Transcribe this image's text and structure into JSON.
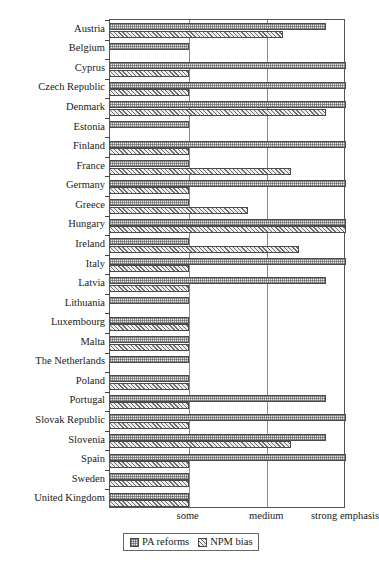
{
  "chart_data": {
    "type": "bar",
    "orientation": "horizontal",
    "title": "",
    "xlabel": "",
    "ylabel": "",
    "grid": true,
    "legend_position": "bottom-center",
    "xlim": [
      0,
      3
    ],
    "xtick_values": [
      1,
      2,
      3
    ],
    "xtick_labels": [
      "some",
      "medium",
      "strong emphasis"
    ],
    "categories": [
      "Austria",
      "Belgium",
      "Cyprus",
      "Czech Republic",
      "Denmark",
      "Estonia",
      "Finland",
      "France",
      "Germany",
      "Greece",
      "Hungary",
      "Ireland",
      "Italy",
      "Latvia",
      "Lithuania",
      "Luxembourg",
      "Malta",
      "The Netherlands",
      "Poland",
      "Portugal",
      "Slovak Republic",
      "Slovenia",
      "Spain",
      "Sweden",
      "United Kingdom"
    ],
    "series": [
      {
        "name": "PA reforms",
        "pattern": "dotted",
        "values": [
          2.75,
          1.0,
          3.0,
          3.0,
          3.0,
          1.0,
          3.0,
          1.0,
          3.0,
          1.0,
          3.0,
          1.0,
          3.0,
          2.75,
          1.0,
          1.0,
          1.0,
          1.0,
          1.0,
          2.75,
          3.0,
          2.75,
          3.0,
          1.0,
          1.0
        ]
      },
      {
        "name": "NPM bias",
        "pattern": "hatched",
        "values": [
          2.2,
          0.0,
          1.0,
          1.0,
          2.75,
          0.0,
          1.0,
          2.3,
          1.0,
          1.75,
          3.0,
          2.4,
          1.0,
          1.0,
          0.0,
          1.0,
          1.0,
          0.0,
          1.0,
          1.0,
          1.0,
          2.3,
          1.0,
          1.0,
          1.0
        ]
      }
    ]
  },
  "legend": {
    "items": [
      {
        "label": "PA reforms",
        "swatch": "dotted-swatch"
      },
      {
        "label": "NPM bias",
        "swatch": "hatched-swatch"
      }
    ]
  }
}
